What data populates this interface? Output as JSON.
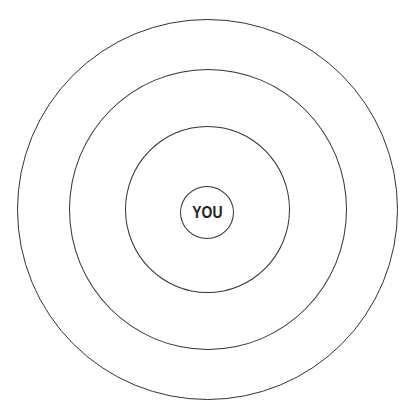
{
  "diagram": {
    "type": "concentric-circles",
    "center_label": "YOU",
    "stroke_color": "#333333",
    "background": "#ffffff",
    "rings": [
      {
        "name": "outer-ring",
        "radius": 190
      },
      {
        "name": "second-ring",
        "radius": 139
      },
      {
        "name": "third-ring",
        "radius": 82
      },
      {
        "name": "center-ring",
        "radius": 26
      }
    ]
  }
}
